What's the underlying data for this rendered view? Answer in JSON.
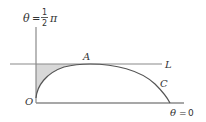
{
  "figure": {
    "top_label": {
      "theta": "θ",
      "equals": "=",
      "numerator": "1",
      "denominator": "2",
      "pi": "π"
    },
    "right_label": {
      "theta": "θ",
      "equals": "=",
      "value": "0"
    },
    "point_A": "A",
    "line_L": "L",
    "curve_C": "C",
    "origin_O": "O"
  },
  "colors": {
    "line": "#8a8a8a",
    "curve": "#555555",
    "shade": "#d8d8d8",
    "text": "#333333"
  }
}
